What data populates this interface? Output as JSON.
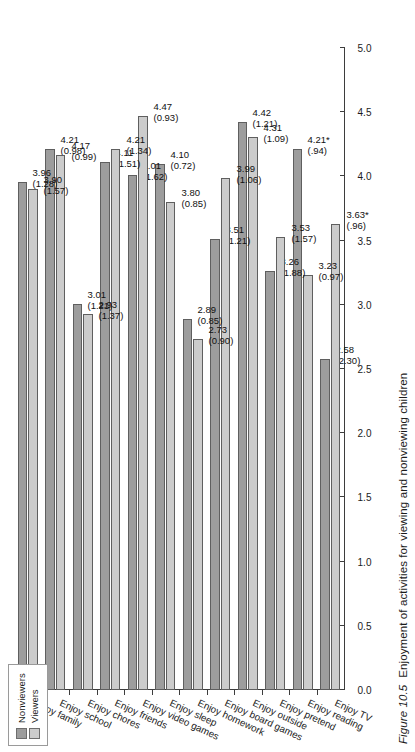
{
  "figure": {
    "number": "Figure 10.5",
    "caption": "Enjoyment of activities for viewing and nonviewing children"
  },
  "legend": {
    "position": "top-left",
    "items": [
      {
        "label": "Nonviewers",
        "color": "#9d9d9d"
      },
      {
        "label": "Viewers",
        "color": "#cccccc"
      }
    ]
  },
  "chart_data": {
    "type": "bar",
    "orientation": "horizontal",
    "title": "",
    "xlabel": "",
    "ylabel": "",
    "ylim": [
      0.0,
      5.0
    ],
    "grid": false,
    "tick_labels": [
      "0.0",
      "0.5",
      "1.0",
      "1.5",
      "2.0",
      "2.5",
      "3.0",
      "3.5",
      "4.0",
      "4.5",
      "5.0"
    ],
    "ticks": [
      0.0,
      0.5,
      1.0,
      1.5,
      2.0,
      2.5,
      3.0,
      3.5,
      4.0,
      4.5,
      5.0
    ],
    "categories": [
      "Enjoy TV",
      "Enjoy reading",
      "Enjoy pretend",
      "Enjoy outside",
      "Enjoy board games",
      "Enjoy homework",
      "Enjoy sleep",
      "Enjoy video games",
      "Enjoy friends",
      "Enjoy chores",
      "Enjoy school",
      "Enjoy family"
    ],
    "series": [
      {
        "name": "Nonviewers",
        "color": "#9d9d9d",
        "values": [
          2.58,
          4.21,
          3.26,
          4.42,
          3.51,
          2.89,
          4.1,
          4.01,
          4.11,
          3.01,
          4.21,
          3.96
        ],
        "sd": [
          "(2.30)",
          "(.94)",
          "(1.88)",
          "(1.21)",
          "(1.21)",
          "(0.85)",
          "(0.72)",
          "(1.62)",
          "(1.51)",
          "(1.21)",
          "(0.98)",
          "(1.28)"
        ],
        "labels": [
          "2.58",
          "4.21*",
          "3.26",
          "4.42",
          "3.51",
          "2.89",
          "4.10",
          "4.01",
          "4.11",
          "3.01",
          "4.21",
          "3.96"
        ]
      },
      {
        "name": "Viewers",
        "color": "#cccccc",
        "values": [
          3.63,
          3.23,
          3.53,
          4.31,
          3.99,
          2.73,
          3.8,
          4.47,
          4.21,
          2.93,
          4.17,
          3.9
        ],
        "sd": [
          "(.96)",
          "(0.97)",
          "(1.57)",
          "(1.09)",
          "(1.06)",
          "(0.90)",
          "(0.85)",
          "(0.93)",
          "(1.34)",
          "(1.37)",
          "(0.99)",
          "(1.57)"
        ],
        "labels": [
          "3.63*",
          "3.23",
          "3.53",
          "4.31",
          "3.99",
          "2.73",
          "3.80",
          "4.47",
          "4.21",
          "2.93",
          "4.17",
          "3.90"
        ]
      }
    ],
    "footnote": "* indicates statistically significant difference"
  }
}
